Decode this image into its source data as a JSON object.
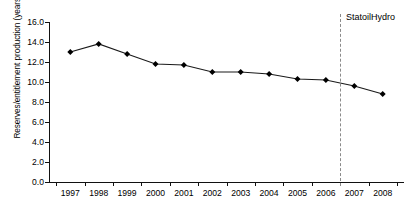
{
  "chart_data": {
    "type": "line",
    "title": "",
    "xlabel": "",
    "ylabel": "Reserves/entitlement production (years)",
    "categories": [
      "1997",
      "1998",
      "1999",
      "2000",
      "2001",
      "2002",
      "2003",
      "2004",
      "2005",
      "2006",
      "2007",
      "2008"
    ],
    "values": [
      13.0,
      13.8,
      12.8,
      11.8,
      11.7,
      11.0,
      11.0,
      10.8,
      10.3,
      10.2,
      9.6,
      8.8
    ],
    "series": [
      {
        "name": "Reserves/entitlement production",
        "values": [
          13.0,
          13.8,
          12.8,
          11.8,
          11.7,
          11.0,
          11.0,
          10.8,
          10.3,
          10.2,
          9.6,
          8.8
        ]
      }
    ],
    "ylim": [
      0.0,
      16.0
    ],
    "ytick_labels": [
      "0.0",
      "2.0",
      "4.0",
      "6.0",
      "8.0",
      "10.0",
      "12.0",
      "14.0",
      "16.0"
    ],
    "ytick_values": [
      0.0,
      2.0,
      4.0,
      6.0,
      8.0,
      10.0,
      12.0,
      14.0,
      16.0
    ],
    "grid": false,
    "legend_position": "none",
    "marker": "diamond",
    "line_color": "#1a1a1a",
    "marker_color": "#000000",
    "annotations": [
      {
        "name": "statoilhydro-divider",
        "label": "StatoilHydro",
        "type": "vertical-dashed-line",
        "x_between": [
          "2006",
          "2007"
        ],
        "color": "#8a8a8a"
      }
    ]
  }
}
